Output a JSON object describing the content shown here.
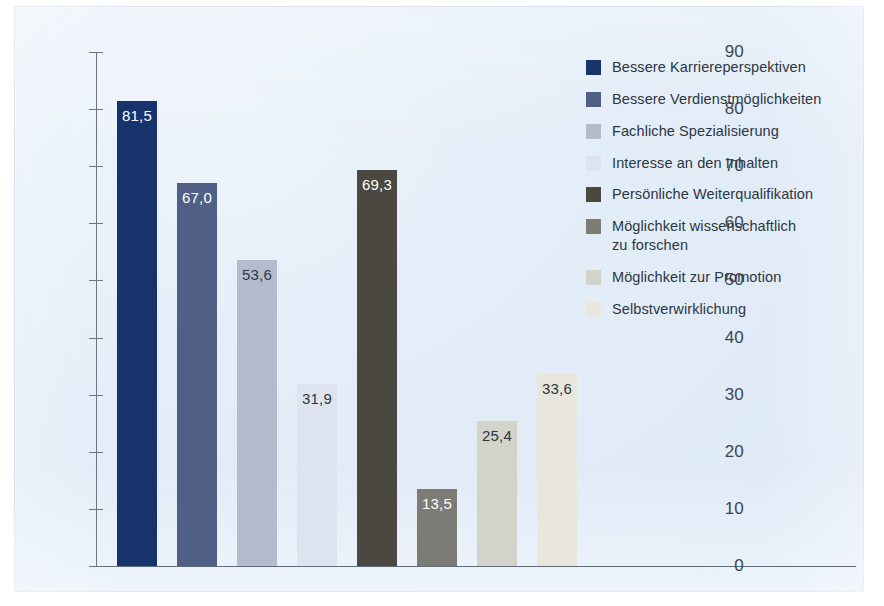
{
  "chart_data": {
    "type": "bar",
    "title": "",
    "subtitle": "",
    "xlabel": "",
    "ylabel": "",
    "ylim": [
      0,
      90
    ],
    "ytick_step": 10,
    "ytick_labels": [
      "90",
      "80",
      "70",
      "60",
      "50",
      "40",
      "30",
      "20",
      "10",
      "0"
    ],
    "ytick_values": [
      90,
      80,
      70,
      60,
      50,
      40,
      30,
      20,
      10,
      0
    ],
    "grid": false,
    "legend_position": "right",
    "value_decimal_separator": ",",
    "categories": [
      "Bessere Karriereperspektiven",
      "Bessere Verdienstmöglichkeiten",
      "Fachliche Spezialisierung",
      "Interesse an den Inhalten",
      "Persönliche Weiterqualifikation",
      "Möglichkeit wissenschaftlich zu forschen",
      "Möglichkeit zur Promotion",
      "Selbstverwirklichung"
    ],
    "values": [
      81.5,
      67.0,
      53.6,
      31.9,
      69.3,
      13.5,
      25.4,
      33.6
    ],
    "value_labels": [
      "81,5",
      "67,0",
      "53,6",
      "31,9",
      "69,3",
      "13,5",
      "25,4",
      "33,6"
    ],
    "colors": [
      "#17336b",
      "#4f5f86",
      "#b3bccd",
      "#dde4ef",
      "#4a4840",
      "#7d7b76",
      "#d3d2cb",
      "#e8e6dd"
    ],
    "label_on_dark": [
      true,
      true,
      false,
      false,
      true,
      true,
      false,
      false
    ]
  },
  "legend": {
    "items": [
      {
        "label": "Bessere Karriereperspektiven",
        "color": "#17336b"
      },
      {
        "label": "Bessere Verdienstmöglichkeiten",
        "color": "#4f5f86"
      },
      {
        "label": "Fachliche Spezialisierung",
        "color": "#b3bccd"
      },
      {
        "label": "Interesse an den Inhalten",
        "color": "#dde4ef"
      },
      {
        "label": "Persönliche Weiterqualifikation",
        "color": "#4a4840"
      },
      {
        "label": "Möglichkeit wissenschaftlich\nzu forschen",
        "color": "#7d7b76"
      },
      {
        "label": "Möglichkeit zur Promotion",
        "color": "#d3d2cb"
      },
      {
        "label": "Selbstverwirklichung",
        "color": "#e8e6dd"
      }
    ]
  },
  "axis": {
    "ticks": [
      {
        "label": "90",
        "value": 90
      },
      {
        "label": "80",
        "value": 80
      },
      {
        "label": "70",
        "value": 70
      },
      {
        "label": "60",
        "value": 60
      },
      {
        "label": "50",
        "value": 50
      },
      {
        "label": "40",
        "value": 40
      },
      {
        "label": "30",
        "value": 30
      },
      {
        "label": "20",
        "value": 20
      },
      {
        "label": "10",
        "value": 10
      },
      {
        "label": "0",
        "value": 0
      }
    ]
  },
  "style": {
    "panel_background": "#e3edf8",
    "axis_color": "#6a7682",
    "text_color": "#2c3640"
  }
}
